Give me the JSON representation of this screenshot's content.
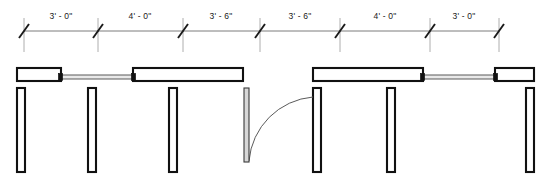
{
  "drawing": {
    "title": "Partition wall elevation dimension plan",
    "type": "architectural-floor-plan",
    "units": "feet-inches",
    "canvas": {
      "width": 553,
      "height": 182
    },
    "colors": {
      "background": "#ffffff",
      "wall_stroke": "#111111",
      "wall_fill": "#ffffff",
      "glass_fill": "#e9e9e9",
      "glass_stroke": "#4a4a4a",
      "dimension_line": "#5a5a5a",
      "extension_line": "#9a9a9a",
      "tick_mark": "#1a1a1a",
      "text": "#1a1a1a",
      "door_leaf_fill": "#d8d8d8",
      "door_arc": "#5a5a5a"
    }
  },
  "dimension_string": {
    "label": "overall-dimension-run",
    "line_y": 31,
    "text_y": 19,
    "extension_top": 18,
    "extension_bottom": 52,
    "tick_half_length": 7,
    "tick_slope_dx": 5,
    "witness_x": [
      24,
      98,
      183,
      260,
      340,
      430,
      499
    ],
    "segments": [
      {
        "index": 1,
        "label": "3' - 0\"",
        "x_start": 24,
        "x_end": 98,
        "center_x": 61
      },
      {
        "index": 2,
        "label": "4' - 0\"",
        "x_start": 98,
        "x_end": 183,
        "center_x": 140
      },
      {
        "index": 3,
        "label": "3' - 6\"",
        "x_start": 183,
        "x_end": 260,
        "center_x": 221
      },
      {
        "index": 4,
        "label": "3' - 6\"",
        "x_start": 260,
        "x_end": 340,
        "center_x": 300
      },
      {
        "index": 5,
        "label": "4' - 0\"",
        "x_start": 340,
        "x_end": 430,
        "center_x": 385
      },
      {
        "index": 6,
        "label": "3' - 0\"",
        "x_start": 430,
        "x_end": 499,
        "center_x": 464
      }
    ]
  },
  "plan": {
    "head_wall_top_y": 68,
    "head_wall_bottom_y": 81,
    "fin_wall_top_y": 88,
    "fin_wall_bottom_y": 172,
    "wall_thickness": 8,
    "left_assembly": {
      "name": "left-wall-assembly",
      "head_walls": [
        {
          "name": "head-wall-left-outer",
          "x": 17,
          "width": 44
        },
        {
          "name": "head-wall-left-inner",
          "x": 133,
          "width": 110
        }
      ],
      "windows": [
        {
          "name": "window-left",
          "x_start": 61,
          "x_end": 133,
          "glass_y": 75,
          "glass_height": 4
        }
      ],
      "fin_walls": [
        {
          "name": "fin-wall-left-end",
          "x": 17
        },
        {
          "name": "fin-wall-left-mid",
          "x": 88
        },
        {
          "name": "fin-wall-left-jamb",
          "x": 169
        }
      ]
    },
    "right_assembly": {
      "name": "right-wall-assembly",
      "head_walls": [
        {
          "name": "head-wall-right-inner",
          "x": 313,
          "width": 110
        },
        {
          "name": "head-wall-right-outer",
          "x": 495,
          "width": 39
        }
      ],
      "windows": [
        {
          "name": "window-right",
          "x_start": 423,
          "x_end": 495,
          "glass_y": 75,
          "glass_height": 4
        }
      ],
      "fin_walls": [
        {
          "name": "fin-wall-right-jamb",
          "x": 313
        },
        {
          "name": "fin-wall-right-mid",
          "x": 387
        },
        {
          "name": "fin-wall-right-end",
          "x": 526
        }
      ]
    },
    "door": {
      "name": "swing-door",
      "hinge_x": 313,
      "hinge_y": 88,
      "leaf_x": 244,
      "leaf_width": 5,
      "leaf_top_y": 88,
      "leaf_bottom_y": 162,
      "swing_radius": 70,
      "swing_direction": "counter-clockwise-down-left",
      "arc_start_x": 249,
      "arc_start_y": 161,
      "arc_end_x": 313,
      "arc_end_y": 97
    }
  }
}
